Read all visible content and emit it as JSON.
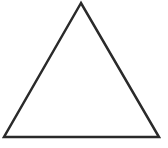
{
  "canvas": {
    "width": 168,
    "height": 148,
    "background": "#ffffff"
  },
  "shape": {
    "type": "triangle",
    "kind": "equilateral-outline",
    "points": [
      [
        81,
        3
      ],
      [
        4,
        137
      ],
      [
        159,
        137
      ]
    ],
    "stroke": "#2a2a2a",
    "stroke_width": 2.5,
    "fill": "none"
  }
}
